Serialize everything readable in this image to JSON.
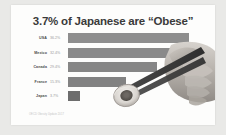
{
  "card": {
    "title_prefix": "3.7%",
    "title_rest": " of Japanese are “Obese”",
    "title_full": "3.7% of Japanese are “Obese”",
    "source": "OECD Obesity Update 2017",
    "background_color": "#fdfdfc",
    "page_background_color": "#e9e9e7"
  },
  "illustration": {
    "name": "hand-holding-chopsticks-with-sushi",
    "description": "A photographic hand gripping a pair of chopsticks holding a sushi roll"
  },
  "chart_data": {
    "type": "bar",
    "orientation": "horizontal",
    "title": "3.7% of Japanese are “Obese”",
    "xlabel": "",
    "ylabel": "",
    "categories": [
      "USA",
      "Mexico",
      "Canada",
      "France",
      "Japan"
    ],
    "values": [
      36.2,
      32.4,
      29.4,
      15.3,
      3.7
    ],
    "value_labels": [
      "36.2%",
      "32.4%",
      "29.4%",
      "15.3%",
      "3.7%"
    ],
    "xlim": [
      0,
      40
    ],
    "grid": false,
    "legend": false,
    "bar_colors": [
      "#8e8e8e",
      "#8a8a8a",
      "#868686",
      "#828282",
      "#6d6d6d"
    ],
    "highlight_index": 4,
    "bars": [
      {
        "label": "USA",
        "value": 36.2,
        "value_label": "36.2%",
        "color": "#8e8e8e",
        "width_px": 121
      },
      {
        "label": "Mexico",
        "value": 32.4,
        "value_label": "32.4%",
        "color": "#8a8a8a",
        "width_px": 103
      },
      {
        "label": "Canada",
        "value": 29.4,
        "value_label": "29.4%",
        "color": "#868686",
        "width_px": 89
      },
      {
        "label": "France",
        "value": 15.3,
        "value_label": "15.3%",
        "color": "#828282",
        "width_px": 58
      },
      {
        "label": "Japan",
        "value": 3.7,
        "value_label": "3.7%",
        "color": "#6d6d6d",
        "width_px": 12
      }
    ]
  }
}
